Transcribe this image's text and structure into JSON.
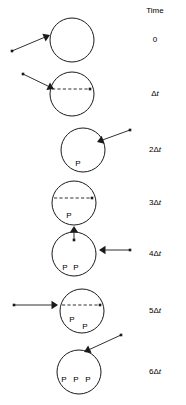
{
  "figure": {
    "type": "diagram",
    "title": "",
    "canvas": {
      "width": 186,
      "height": 405,
      "background": "#ffffff"
    },
    "stroke_color": "#1a1a1a",
    "column_header": "Time"
  },
  "rows": [
    {
      "id": "row-0",
      "time_label": "0",
      "circle": {
        "cx": 72,
        "cy": 40,
        "r": 22
      },
      "particles_inside": [],
      "dashed_chord": null,
      "arrow": {
        "direction": "from-lower-left",
        "tail": {
          "x": 12,
          "y": 51
        },
        "head": {
          "x": 50,
          "y": 35
        },
        "dot_at_tail": true
      }
    },
    {
      "id": "row-1",
      "time_label": "Δt",
      "circle": {
        "cx": 72,
        "cy": 94,
        "r": 22
      },
      "particles_inside": [],
      "dashed_chord": {
        "x1": 52,
        "y1": 89,
        "x2": 90,
        "y2": 89,
        "dot_end": "right"
      },
      "arrow": {
        "direction": "from-upper-left",
        "tail": {
          "x": 23,
          "y": 74
        },
        "head": {
          "x": 54,
          "y": 89
        },
        "dot_at_tail": true
      }
    },
    {
      "id": "row-2",
      "time_label": "2Δt",
      "circle": {
        "cx": 83,
        "cy": 150,
        "r": 22
      },
      "particles_inside": [
        {
          "letter": "P",
          "x": 78,
          "y": 164,
          "size": 8
        }
      ],
      "dashed_chord": null,
      "arrow": {
        "direction": "from-upper-right",
        "tail": {
          "x": 130,
          "y": 130
        },
        "head": {
          "x": 97,
          "y": 142
        },
        "dot_at_tail": true
      }
    },
    {
      "id": "row-3",
      "time_label": "3Δt",
      "circle": {
        "cx": 74,
        "cy": 203,
        "r": 22
      },
      "particles_inside": [
        {
          "letter": "P",
          "x": 69,
          "y": 216,
          "size": 8
        }
      ],
      "dashed_chord": {
        "x1": 54,
        "y1": 198,
        "x2": 92,
        "y2": 198,
        "dot_end": "right"
      },
      "arrow": {
        "direction": "from-below",
        "tail": {
          "x": 74,
          "y": 240
        },
        "head": {
          "x": 74,
          "y": 226
        },
        "dot_at_tail": true
      }
    },
    {
      "id": "row-4",
      "time_label": "4Δt",
      "circle": {
        "cx": 74,
        "cy": 254,
        "r": 22
      },
      "particles_inside": [
        {
          "letter": "P",
          "x": 65,
          "y": 268,
          "size": 8
        },
        {
          "letter": "P",
          "x": 76,
          "y": 268,
          "size": 8
        }
      ],
      "dashed_chord": null,
      "arrow": {
        "direction": "from-right",
        "tail": {
          "x": 130,
          "y": 250
        },
        "head": {
          "x": 99,
          "y": 250
        },
        "dot_at_tail": true
      }
    },
    {
      "id": "row-5",
      "time_label": "5Δt",
      "circle": {
        "cx": 82,
        "cy": 311,
        "r": 22
      },
      "particles_inside": [
        {
          "letter": "P",
          "x": 72,
          "y": 320,
          "size": 8
        },
        {
          "letter": "P",
          "x": 85,
          "y": 327,
          "size": 8
        }
      ],
      "dashed_chord": {
        "x1": 62,
        "y1": 305,
        "x2": 100,
        "y2": 305,
        "dot_end": "right"
      },
      "arrow": {
        "direction": "from-left",
        "tail": {
          "x": 14,
          "y": 305
        },
        "head": {
          "x": 58,
          "y": 305
        },
        "dot_at_tail": true
      }
    },
    {
      "id": "row-6",
      "time_label": "6Δt",
      "circle": {
        "cx": 79,
        "cy": 372,
        "r": 22
      },
      "particles_inside": [
        {
          "letter": "P",
          "x": 64,
          "y": 380,
          "size": 8
        },
        {
          "letter": "P",
          "x": 76,
          "y": 380,
          "size": 8
        },
        {
          "letter": "P",
          "x": 88,
          "y": 380,
          "size": 8
        }
      ],
      "dashed_chord": null,
      "arrow": {
        "direction": "from-upper-right",
        "tail": {
          "x": 121,
          "y": 335
        },
        "head": {
          "x": 84,
          "y": 352
        },
        "dot_at_tail": true
      }
    }
  ],
  "time_column": {
    "header": "Time",
    "header_x": 155,
    "header_y": 11,
    "entries": [
      {
        "text": "0",
        "x": 155,
        "y": 40
      },
      {
        "text": "Δt",
        "x": 155,
        "y": 94
      },
      {
        "text": "2Δt",
        "x": 155,
        "y": 150
      },
      {
        "text": "3Δt",
        "x": 155,
        "y": 203
      },
      {
        "text": "4Δt",
        "x": 155,
        "y": 254
      },
      {
        "text": "5Δt",
        "x": 155,
        "y": 311
      },
      {
        "text": "6Δt",
        "x": 155,
        "y": 372
      }
    ]
  }
}
